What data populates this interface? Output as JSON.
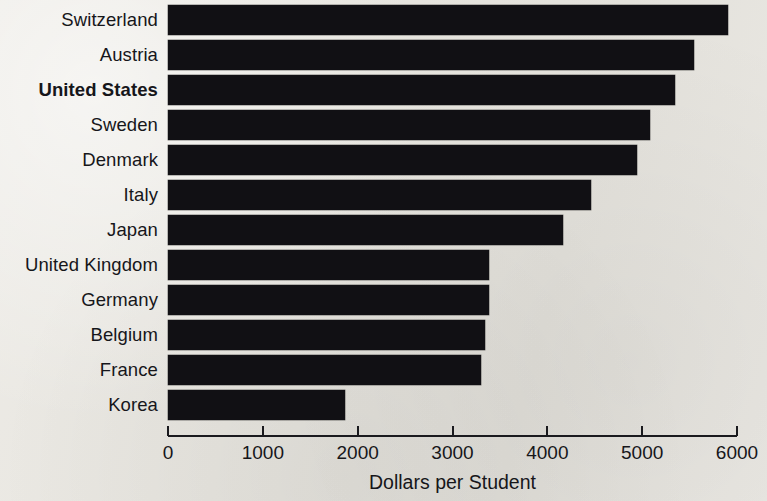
{
  "chart_data": {
    "type": "bar",
    "orientation": "horizontal",
    "title": "",
    "xlabel": "Dollars per Student",
    "ylabel": "",
    "xlim": [
      0,
      6000
    ],
    "xticks": [
      0,
      1000,
      2000,
      3000,
      4000,
      5000,
      6000
    ],
    "xtick_labels": [
      "0",
      "1000",
      "2000",
      "3000",
      "4000",
      "5000",
      "6000"
    ],
    "grid": false,
    "legend": false,
    "bar_color": "#111014",
    "background_color": "#e9e7e2",
    "highlighted_category": "United States",
    "categories": [
      "Switzerland",
      "Austria",
      "United States",
      "Sweden",
      "Denmark",
      "Italy",
      "Japan",
      "United Kingdom",
      "Germany",
      "Belgium",
      "France",
      "Korea"
    ],
    "values": [
      5900,
      5550,
      5350,
      5080,
      4950,
      4460,
      4160,
      3380,
      3380,
      3340,
      3300,
      1870
    ]
  }
}
